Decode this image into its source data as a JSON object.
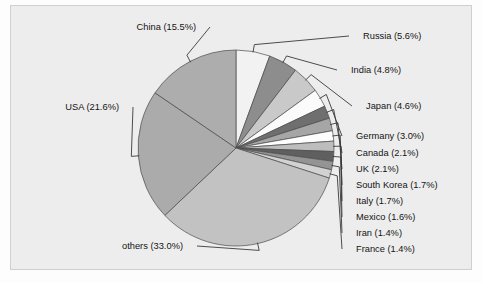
{
  "chart_data": {
    "type": "pie",
    "title": "",
    "subtitle": "",
    "xlabel": "",
    "ylabel": "",
    "legend_position": "none",
    "grid": false,
    "units": "percent",
    "label_format": "{name} ({value}%)",
    "start_angle_deg": 0,
    "direction": "clockwise",
    "categories": [
      "Russia",
      "India",
      "Japan",
      "Germany",
      "Canada",
      "UK",
      "South Korea",
      "Italy",
      "Mexico",
      "Iran",
      "France",
      "others",
      "USA",
      "China"
    ],
    "values": [
      5.6,
      4.8,
      4.6,
      3.0,
      2.1,
      2.1,
      1.7,
      1.7,
      1.6,
      1.4,
      1.4,
      33.0,
      21.6,
      15.5
    ],
    "slices": [
      {
        "name": "Russia",
        "value": 5.6,
        "label": "Russia (5.6%)",
        "color": "#f2f2f2",
        "label_side": "right"
      },
      {
        "name": "India",
        "value": 4.8,
        "label": "India (4.8%)",
        "color": "#8d8d8d",
        "label_side": "right"
      },
      {
        "name": "Japan",
        "value": 4.6,
        "label": "Japan (4.6%)",
        "color": "#c9c9c9",
        "label_side": "right"
      },
      {
        "name": "Germany",
        "value": 3.0,
        "label": "Germany (3.0%)",
        "color": "#fbfbfb",
        "label_side": "right"
      },
      {
        "name": "Canada",
        "value": 2.1,
        "label": "Canada (2.1%)",
        "color": "#6f6f6f",
        "label_side": "right"
      },
      {
        "name": "UK",
        "value": 2.1,
        "label": "UK (2.1%)",
        "color": "#a6a6a6",
        "label_side": "right"
      },
      {
        "name": "South Korea",
        "value": 1.7,
        "label": "South Korea (1.7%)",
        "color": "#fdfdfd",
        "label_side": "right"
      },
      {
        "name": "Italy",
        "value": 1.7,
        "label": "Italy (1.7%)",
        "color": "#bdbdbd",
        "label_side": "right"
      },
      {
        "name": "Mexico",
        "value": 1.6,
        "label": "Mexico (1.6%)",
        "color": "#5f5f5f",
        "label_side": "right"
      },
      {
        "name": "Iran",
        "value": 1.4,
        "label": "Iran (1.4%)",
        "color": "#949494",
        "label_side": "right"
      },
      {
        "name": "France",
        "value": 1.4,
        "label": "France (1.4%)",
        "color": "#d2d2d2",
        "label_side": "right"
      },
      {
        "name": "others",
        "value": 33.0,
        "label": "others (33.0%)",
        "color": "#c2c2c2",
        "label_side": "left"
      },
      {
        "name": "USA",
        "value": 21.6,
        "label": "USA (21.6%)",
        "color": "#ababab",
        "label_side": "left"
      },
      {
        "name": "China",
        "value": 15.5,
        "label": "China (15.5%)",
        "color": "#adadad",
        "label_side": "left"
      }
    ],
    "total": 100.0
  },
  "figure": {
    "background_color": "#ededed",
    "border_color": "#cfcfcf",
    "text_color": "#141414",
    "slice_edge_color": "#4a4a4a"
  },
  "labels": {
    "Russia": "Russia (5.6%)",
    "India": "India (4.8%)",
    "Japan": "Japan (4.6%)",
    "Germany": "Germany (3.0%)",
    "Canada": "Canada (2.1%)",
    "UK": "UK (2.1%)",
    "SouthKorea": "South Korea (1.7%)",
    "Italy": "Italy (1.7%)",
    "Mexico": "Mexico (1.6%)",
    "Iran": "Iran (1.4%)",
    "France": "France (1.4%)",
    "others": "others (33.0%)",
    "USA": "USA (21.6%)",
    "China": "China (15.5%)"
  }
}
